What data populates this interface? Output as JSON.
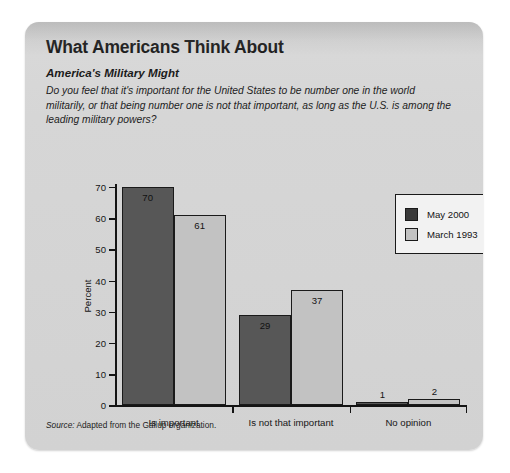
{
  "card": {
    "title": "What Americans Think About",
    "subtitle": "America's Military Might",
    "question": "Do you feel that it's important for the United States to be number one in the world militarily, or that being number one is not that important, as long as the U.S. is among the leading military powers?",
    "source_label": "Source:",
    "source_text": " Adapted from the Gallup organization."
  },
  "colors": {
    "dark_bar": "#575757",
    "light_bar": "#c2c2c2",
    "card_bg": "#d6d6d6",
    "axis": "#141414"
  },
  "chart_data": {
    "type": "bar",
    "title": "America's Military Might",
    "xlabel": "",
    "ylabel": "Percent",
    "ylim": [
      0,
      70
    ],
    "yticks": [
      0,
      10,
      20,
      30,
      40,
      50,
      60,
      70
    ],
    "ytick_labels": [
      "0",
      "10",
      "20",
      "30",
      "40",
      "50",
      "60",
      "70"
    ],
    "grid": false,
    "legend_position": "top-right",
    "categories": [
      "Is important",
      "Is not that important",
      "No opinion"
    ],
    "series": [
      {
        "name": "May 2000",
        "values": [
          70,
          29,
          1
        ],
        "color": "#575757"
      },
      {
        "name": "March 1993",
        "values": [
          61,
          37,
          2
        ],
        "color": "#c2c2c2"
      }
    ],
    "data_labels": [
      {
        "category": "Is important",
        "series": "May 2000",
        "value": "70",
        "placement": "inside"
      },
      {
        "category": "Is important",
        "series": "March 1993",
        "value": "61",
        "placement": "inside"
      },
      {
        "category": "Is not that important",
        "series": "May 2000",
        "value": "29",
        "placement": "inside"
      },
      {
        "category": "Is not that important",
        "series": "March 1993",
        "value": "37",
        "placement": "inside"
      },
      {
        "category": "No opinion",
        "series": "May 2000",
        "value": "1",
        "placement": "above"
      },
      {
        "category": "No opinion",
        "series": "March 1993",
        "value": "2",
        "placement": "above"
      }
    ]
  }
}
